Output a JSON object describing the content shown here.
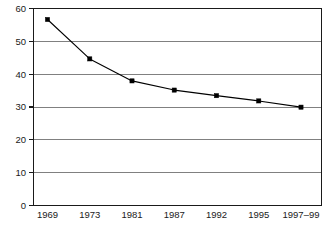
{
  "chart_data": {
    "type": "line",
    "title": "",
    "subtitle": "",
    "xlabel": "",
    "ylabel": "",
    "categories": [
      "1969",
      "1973",
      "1981",
      "1987",
      "1992",
      "1995",
      "1997–99"
    ],
    "values": [
      56.5,
      44.5,
      37.8,
      35.0,
      33.3,
      31.7,
      29.8
    ],
    "series": [
      {
        "name": "",
        "values": [
          56.5,
          44.5,
          37.8,
          35.0,
          33.3,
          31.7,
          29.8
        ]
      }
    ],
    "ylim": [
      0,
      60
    ],
    "yticks": [
      0,
      10,
      20,
      30,
      40,
      50,
      60
    ],
    "ytick_labels": [
      "0",
      "10",
      "20",
      "30",
      "40",
      "50",
      "60"
    ],
    "xtick_labels": [
      "1969",
      "1973",
      "1981",
      "1987",
      "1992",
      "1995",
      "1997–99"
    ],
    "grid": true,
    "grid_axis": "y",
    "legend": false,
    "legend_position": "none",
    "marker": "square",
    "annotations": []
  },
  "style": {
    "background_color": "#ffffff",
    "line_color": "#000000",
    "marker_color": "#000000",
    "grid_color": "#808080",
    "axis_color": "#1a1a1a",
    "label_color": "#1a1a1a"
  },
  "plot_geometry": {
    "left": 33,
    "right": 322,
    "top": 8,
    "bottom": 205,
    "width": 331,
    "height": 225
  }
}
